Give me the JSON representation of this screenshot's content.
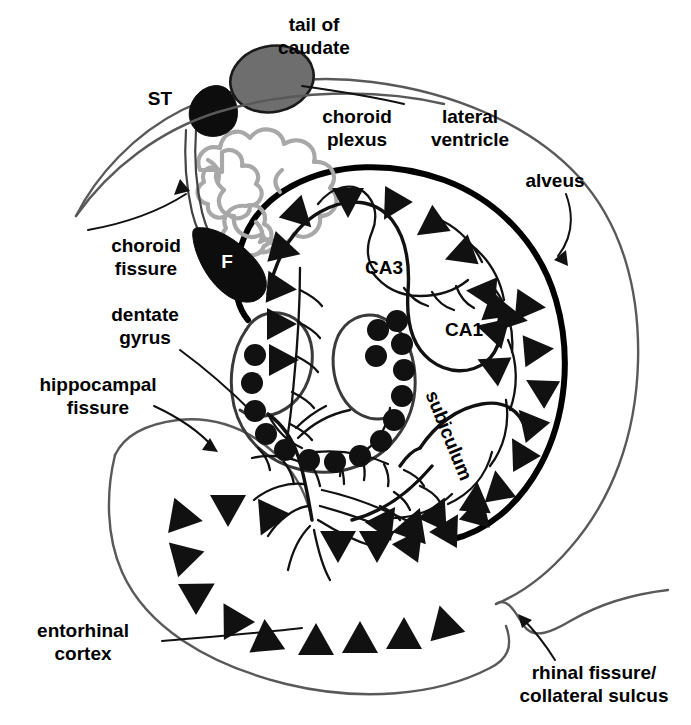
{
  "figure": {
    "background_color": "#ffffff"
  },
  "labels": {
    "tail_of_caudate": "tail of\ncaudate",
    "tail_of_caudate_line1": "tail of",
    "tail_of_caudate_line2": "caudate",
    "st": "ST",
    "choroid_plexus_line1": "choroid",
    "choroid_plexus_line2": "plexus",
    "lateral_ventricle_line1": "lateral",
    "lateral_ventricle_line2": "ventricle",
    "alveus": "alveus",
    "choroid_fissure_line1": "choroid",
    "choroid_fissure_line2": "fissure",
    "fimbria": "F",
    "dentate_gyrus_line1": "dentate",
    "dentate_gyrus_line2": "gyrus",
    "hippocampal_fissure_line1": "hippocampal",
    "hippocampal_fissure_line2": "fissure",
    "ca3": "CA3",
    "ca1": "CA1",
    "subiculum": "subiculum",
    "entorhinal_cortex_line1": "entorhinal",
    "entorhinal_cortex_line2": "cortex",
    "rhinal_fissure_line1": "rhinal fissure/",
    "rhinal_fissure_line2": "collateral sulcus"
  },
  "colors": {
    "ink": "#111111",
    "outline_gray": "#595959",
    "caudate_fill": "#6e6e6e",
    "choroid_plexus_gray": "#a8a8a8",
    "black_structure": "#0d0d0d",
    "background": "#ffffff"
  },
  "structures": [
    {
      "name": "tail-of-caudate",
      "kind": "filled-ellipse",
      "fill": "#6e6e6e"
    },
    {
      "name": "stria-terminalis",
      "kind": "filled-blob",
      "fill": "#0d0d0d",
      "abbrev": "ST"
    },
    {
      "name": "choroid-plexus",
      "kind": "lobed-squiggle",
      "stroke": "#a8a8a8"
    },
    {
      "name": "fimbria",
      "kind": "filled-crescent",
      "fill": "#0d0d0d",
      "abbrev": "F"
    },
    {
      "name": "lateral-ventricle",
      "kind": "open-region"
    },
    {
      "name": "alveus",
      "kind": "thick-boundary-line"
    },
    {
      "name": "ca3-pyramidal-layer",
      "kind": "triangle-cell-band",
      "cell_shape": "triangle"
    },
    {
      "name": "ca1-pyramidal-layer",
      "kind": "triangle-cell-band",
      "cell_shape": "triangle"
    },
    {
      "name": "dentate-gyrus-granule-layer",
      "kind": "dot-cell-band",
      "cell_shape": "circle"
    },
    {
      "name": "subiculum",
      "kind": "triangle-cell-band",
      "cell_shape": "triangle"
    },
    {
      "name": "entorhinal-cortex",
      "kind": "triangle-cell-field",
      "cell_shape": "triangle"
    },
    {
      "name": "rhinal-fissure-collateral-sulcus",
      "kind": "sulcus-notch"
    },
    {
      "name": "hippocampal-fissure",
      "kind": "fissure-line"
    },
    {
      "name": "choroid-fissure",
      "kind": "fissure-line"
    }
  ],
  "cell_counts": {
    "dentate_granule_dots": 16,
    "ca3_pyramidal_triangles": 12,
    "ca1_subiculum_triangles": 14,
    "entorhinal_triangles": 14
  }
}
